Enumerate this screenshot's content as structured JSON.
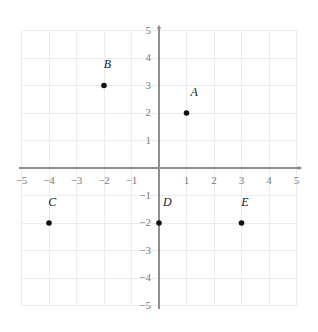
{
  "chart_data": {
    "type": "scatter",
    "title": "",
    "xlabel": "",
    "ylabel": "",
    "xlim": [
      -5,
      5
    ],
    "ylim": [
      -5,
      5
    ],
    "grid": true,
    "legend": "none",
    "x_ticks": [
      -5,
      -4,
      -3,
      -2,
      -1,
      1,
      2,
      3,
      4,
      5
    ],
    "y_ticks": [
      5,
      4,
      3,
      2,
      1,
      -1,
      -2,
      -3,
      -4,
      -5
    ],
    "x_tick_labels": [
      "−5",
      "−4",
      "−3",
      "−2",
      "−1",
      "1",
      "2",
      "3",
      "4",
      "5"
    ],
    "y_tick_labels": [
      "5",
      "4",
      "3",
      "2",
      "1",
      "−1",
      "−2",
      "−3",
      "−4",
      "−5"
    ],
    "points": [
      {
        "label": "A",
        "x": 1,
        "y": 2,
        "label_dx": 0.28,
        "label_dy": 0.62
      },
      {
        "label": "B",
        "x": -2,
        "y": 3,
        "label_dx": 0.12,
        "label_dy": 0.62
      },
      {
        "label": "C",
        "x": -4,
        "y": -2,
        "label_dx": 0.12,
        "label_dy": 0.62
      },
      {
        "label": "D",
        "x": 0,
        "y": -2,
        "label_dx": 0.3,
        "label_dy": 0.62
      },
      {
        "label": "E",
        "x": 3,
        "y": -2,
        "label_dx": 0.12,
        "label_dy": 0.62
      }
    ]
  },
  "style": {
    "background_color": "#ffffff",
    "grid_color": "#ececec",
    "axis_color": "#8e8e8e",
    "tick_label_color": "#7b7b7b",
    "point_color": "#111111",
    "point_label_color": "#1a1a1a"
  },
  "geometry": {
    "width": 318,
    "height": 332,
    "origin_x": 159,
    "origin_y": 168,
    "unit_px": 27.5,
    "point_radius": 2.8
  }
}
